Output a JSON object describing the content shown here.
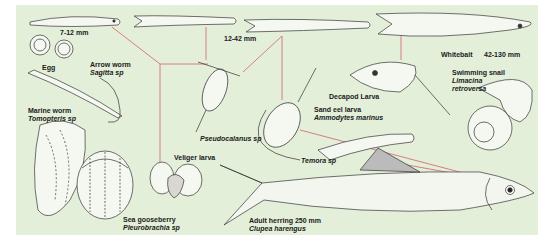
{
  "diagram": {
    "title_visible": false,
    "background_color": "#e4efda",
    "arrow_color": "#d0606a",
    "labels": {
      "larva_size_small": "7-12 mm",
      "egg": "Egg",
      "arrow_worm_common": "Arrow worm",
      "arrow_worm_sci": "Sagitta sp",
      "marine_worm_common": "Marine worm",
      "marine_worm_sci": "Tomopteris sp",
      "larva_size_mid": "12-42 mm",
      "whitebait": "Whitebait",
      "whitebait_size": "42-130 mm",
      "decapod_larva": "Decapod Larva",
      "swimming_snail_common": "Swimming snail",
      "swimming_snail_sci_1": "Limacina",
      "swimming_snail_sci_2": "retroversa",
      "pseudocalanus": "Pseudocalanus sp",
      "sand_eel_common": "Sand eel larva",
      "sand_eel_sci": "Ammodytes marinus",
      "temora": "Temora sp",
      "veliger_larva": "Veliger larva",
      "sea_gooseberry_common": "Sea gooseberry",
      "sea_gooseberry_sci": "Pleurobrachia sp",
      "adult_herring_common": "Adult herring 250 mm",
      "adult_herring_sci": "Clupea harengus"
    },
    "organisms": [
      "herring-larva-7-12mm",
      "herring-egg",
      "arrow-worm",
      "marine-worm",
      "herring-juvenile-12-42mm",
      "whitebait-42-130mm",
      "decapod-larva",
      "swimming-snail",
      "pseudocalanus-copepod",
      "sand-eel-larva",
      "temora-copepod",
      "veliger-larva",
      "sea-gooseberry",
      "adult-herring"
    ]
  }
}
